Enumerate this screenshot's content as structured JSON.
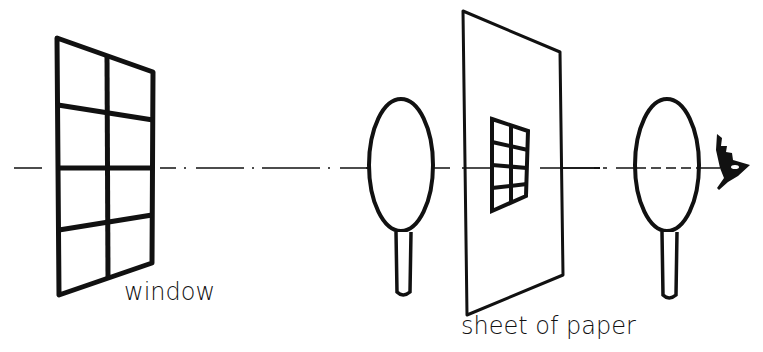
{
  "diagram": {
    "type": "optical-path",
    "labels": {
      "window": "window",
      "sheet": "sheet of paper"
    },
    "elements": [
      {
        "id": "window",
        "kind": "window-grid",
        "rows": 4,
        "cols": 2
      },
      {
        "id": "lens-1",
        "kind": "lens"
      },
      {
        "id": "sheet-of-paper",
        "kind": "screen",
        "image": {
          "rows": 4,
          "cols": 2
        }
      },
      {
        "id": "lens-2",
        "kind": "lens"
      },
      {
        "id": "eye",
        "kind": "eye"
      }
    ],
    "colors": {
      "ink": "#111111",
      "background": "#ffffff"
    }
  }
}
